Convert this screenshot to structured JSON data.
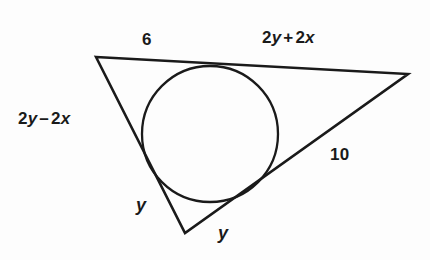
{
  "figure": {
    "type": "geometry-diagram",
    "background_color": "#fdfdfd",
    "stroke_color": "#1a1a1a",
    "labels": {
      "top_left": {
        "text": "6",
        "parts": [
          {
            "t": "6",
            "style": "plain"
          }
        ]
      },
      "top_right": {
        "text": "2y + 2x",
        "parts": [
          {
            "t": "2",
            "style": "plain"
          },
          {
            "t": "y",
            "style": "var"
          },
          {
            "t": "+",
            "style": "op"
          },
          {
            "t": "2",
            "style": "plain"
          },
          {
            "t": "x",
            "style": "var"
          }
        ]
      },
      "left": {
        "text": "2y − 2x",
        "parts": [
          {
            "t": "2",
            "style": "plain"
          },
          {
            "t": "y",
            "style": "var"
          },
          {
            "t": "–",
            "style": "op"
          },
          {
            "t": "2",
            "style": "plain"
          },
          {
            "t": "x",
            "style": "var"
          }
        ]
      },
      "right": {
        "text": "10",
        "parts": [
          {
            "t": "10",
            "style": "plain"
          }
        ]
      },
      "bottom_left": {
        "text": "y",
        "parts": [
          {
            "t": "y",
            "style": "var"
          }
        ]
      },
      "bottom_right": {
        "text": "y",
        "parts": [
          {
            "t": "y",
            "style": "var"
          }
        ]
      }
    },
    "geometry": {
      "triangle": {
        "vertices": [
          {
            "name": "top-left",
            "x": 96,
            "y": 57
          },
          {
            "name": "right",
            "x": 408,
            "y": 74
          },
          {
            "name": "bottom",
            "x": 185,
            "y": 233
          }
        ]
      },
      "circle": {
        "cx": 210,
        "cy": 134,
        "r": 68
      }
    }
  }
}
